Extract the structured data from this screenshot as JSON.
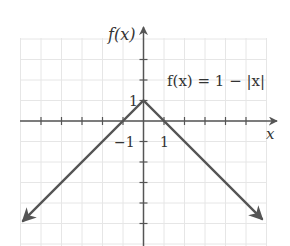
{
  "chart_data": {
    "type": "line",
    "title": "",
    "function_label": "f(x) = 1 − |x|",
    "xlabel": "x",
    "ylabel": "f(x)",
    "xlim": [
      -6,
      6
    ],
    "ylim": [
      -6,
      4
    ],
    "grid": true,
    "tick_labels": {
      "x": [
        {
          "value": 1,
          "label": "1"
        }
      ],
      "y": [
        {
          "value": 1,
          "label": "1"
        },
        {
          "value": -1,
          "label": "−1"
        }
      ]
    },
    "x_ticks": [
      -5,
      -4,
      -3,
      -2,
      -1,
      1,
      2,
      3,
      4,
      5
    ],
    "y_ticks": [
      3,
      2,
      1,
      -1,
      -2,
      -3,
      -4,
      -5
    ],
    "series": [
      {
        "name": "f(x) = 1 − |x|",
        "x": [
          -5.9,
          0,
          5.8
        ],
        "y": [
          -4.9,
          1,
          -4.8
        ],
        "arrows_at_ends": true
      }
    ],
    "colors": {
      "curve": "#555555",
      "axes": "#555555",
      "grid": "#e6e6e6"
    }
  }
}
